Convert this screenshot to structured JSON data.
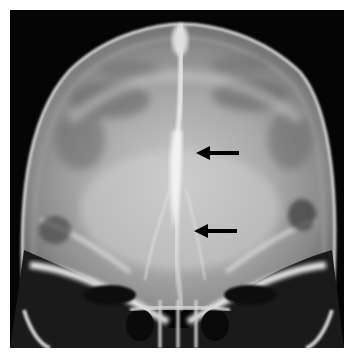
{
  "image": {
    "subject": "skull radiograph, frontal view",
    "background_color": "#ffffff",
    "film_color": "#050505"
  },
  "annotations": {
    "arrows": [
      {
        "label": "arrow-upper",
        "tip": [
          196,
          153
        ],
        "tail": [
          239,
          153
        ],
        "color": "#000000"
      },
      {
        "label": "arrow-lower",
        "tip": [
          194,
          231
        ],
        "tail": [
          237,
          231
        ],
        "color": "#000000"
      }
    ]
  }
}
